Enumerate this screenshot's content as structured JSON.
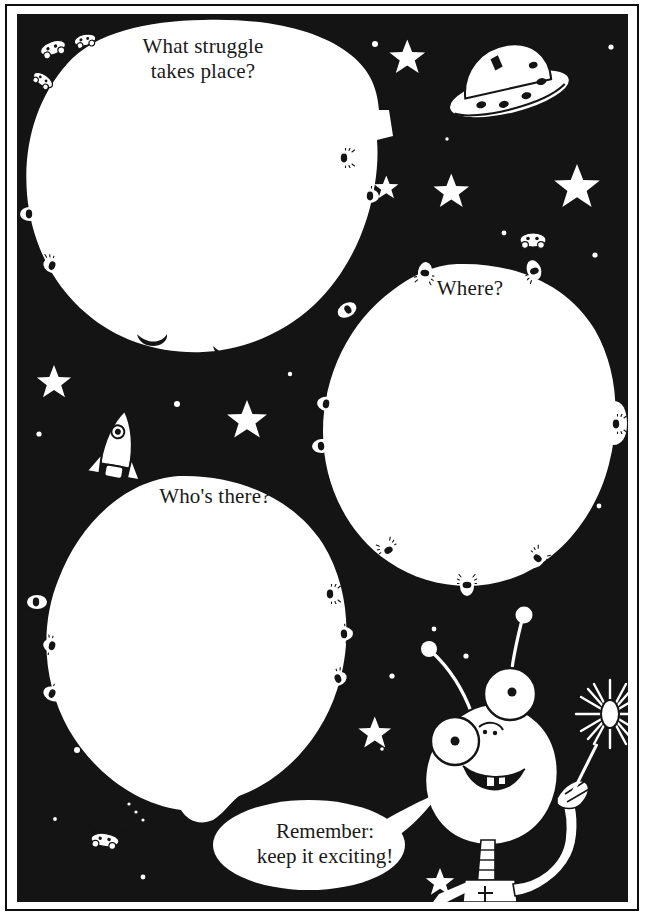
{
  "page": {
    "kind": "worksheet-page",
    "background_color": "#141414",
    "ink_color": "#ffffff",
    "text_color": "#1a1a1a"
  },
  "prompts": [
    {
      "id": "struggle",
      "label": "What struggle\ntakes place?",
      "shape": "planet"
    },
    {
      "id": "where",
      "label": "Where?",
      "shape": "planet"
    },
    {
      "id": "who",
      "label": "Who's there?",
      "shape": "planet"
    }
  ],
  "speech_bubble": {
    "label": "Remember:\nkeep it exciting!",
    "speaker": "alien-character"
  },
  "art": {
    "flying_saucer": "flying-saucer-icon",
    "rocket": "rocket-icon",
    "alien": "alien-character-icon",
    "sparkler": "sparkler-icon",
    "stars": "star-icon",
    "craters": "crater-icon",
    "rovers": "moon-rover-icon"
  }
}
